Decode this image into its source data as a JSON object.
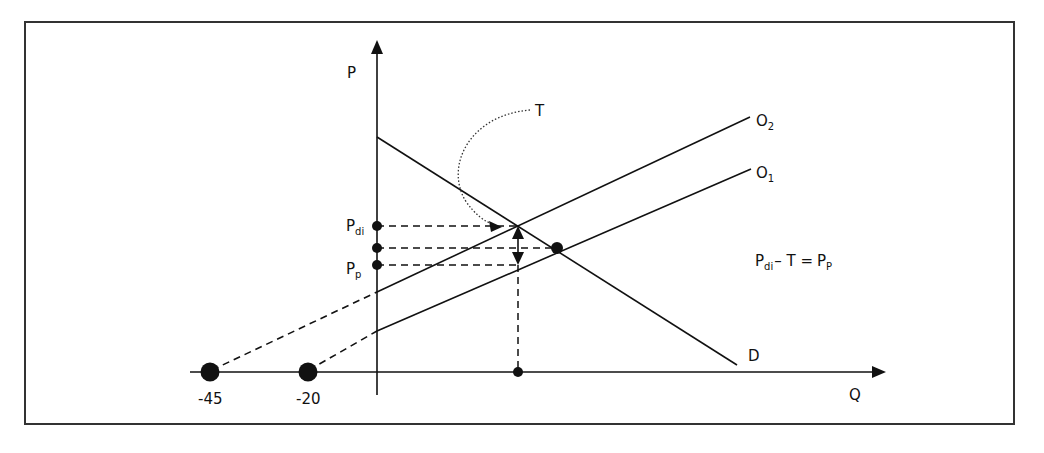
{
  "figure": {
    "frame": {
      "x": 25,
      "y": 22,
      "width": 989,
      "height": 402,
      "stroke": "#333333"
    },
    "colors": {
      "ink": "#111111",
      "background": "#ffffff"
    }
  },
  "axes": {
    "y_label": "P",
    "x_label": "Q"
  },
  "curves": {
    "demand": {
      "label": "D"
    },
    "supply_after_tax": {
      "label": "O",
      "subscript": "2"
    },
    "supply_before_tax": {
      "label": "O",
      "subscript": "1"
    }
  },
  "price_labels": {
    "pdi": {
      "main": "P",
      "sub": "di"
    },
    "pp": {
      "main": "P",
      "sub": "p"
    }
  },
  "tax": {
    "label": "T"
  },
  "equation": {
    "lhs_main": "P",
    "lhs_sub": "di",
    "op1": "– T =",
    "rhs_main": "P",
    "rhs_sub": "P"
  },
  "intercepts": {
    "o2_x_intercept": "-45",
    "o1_x_intercept": "-20"
  }
}
